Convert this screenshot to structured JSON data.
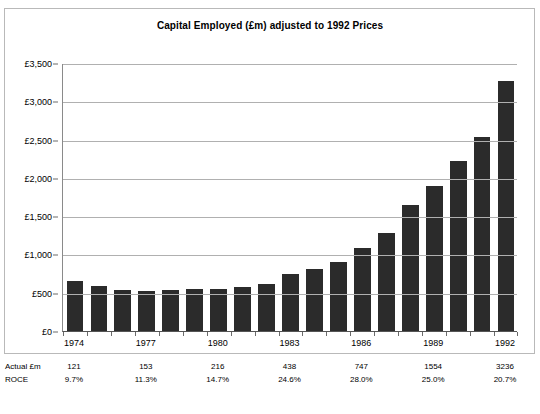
{
  "chart_data": {
    "type": "bar",
    "title": "Capital Employed (£m) adjusted to 1992 Prices",
    "xlabel": "",
    "ylabel": "",
    "grid": true,
    "legend": "none",
    "ylim": [
      0,
      3500
    ],
    "ytick_values": [
      0,
      500,
      1000,
      1500,
      2000,
      2500,
      3000,
      3500
    ],
    "ytick_labels": [
      "£0",
      "£500",
      "£1,000",
      "£1,500",
      "£2,000",
      "£2,500",
      "£3,000",
      "£3,500"
    ],
    "categories": [
      1974,
      1975,
      1976,
      1977,
      1978,
      1979,
      1980,
      1981,
      1982,
      1983,
      1984,
      1985,
      1986,
      1987,
      1988,
      1989,
      1990,
      1991,
      1992
    ],
    "xtick_labels": [
      "1974",
      "1977",
      "1980",
      "1983",
      "1986",
      "1989",
      "1992"
    ],
    "xtick_categories": [
      1974,
      1977,
      1980,
      1983,
      1986,
      1989,
      1992
    ],
    "values": [
      650,
      585,
      540,
      520,
      540,
      545,
      545,
      570,
      620,
      740,
      810,
      895,
      1085,
      1285,
      1645,
      1890,
      2220,
      2535,
      3265
    ],
    "bar_color": "#2b2b2b"
  },
  "table": {
    "rows": [
      {
        "label": "Actual £m",
        "cells": [
          "121",
          "153",
          "216",
          "438",
          "747",
          "1554",
          "3236"
        ]
      },
      {
        "label": "ROCE",
        "cells": [
          "9.7%",
          "11.3%",
          "14.7%",
          "24.6%",
          "28.0%",
          "25.0%",
          "20.7%"
        ]
      }
    ]
  }
}
